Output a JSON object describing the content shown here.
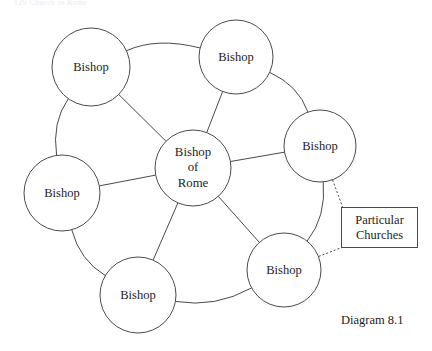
{
  "page_header": "126   Church in Rome",
  "figure": {
    "caption": "Diagram 8.1",
    "callout": {
      "label": "Particular\nChurches",
      "line1": "Particular",
      "line2": "Churches"
    },
    "hub": {
      "label": "Bishop\nof\nRome",
      "line1": "Bishop",
      "line2": "of",
      "line3": "Rome",
      "cx": 193,
      "cy": 168,
      "r": 38
    },
    "ring_nodes": [
      {
        "id": "bishop-top-left",
        "label": "Bishop",
        "cx": 91,
        "cy": 67,
        "r": 39
      },
      {
        "id": "bishop-top-right",
        "label": "Bishop",
        "cx": 236,
        "cy": 57,
        "r": 37
      },
      {
        "id": "bishop-right",
        "label": "Bishop",
        "cx": 320,
        "cy": 146,
        "r": 36
      },
      {
        "id": "bishop-bottom-right",
        "label": "Bishop",
        "cx": 284,
        "cy": 270,
        "r": 37
      },
      {
        "id": "bishop-bottom-left",
        "label": "Bishop",
        "cx": 138,
        "cy": 295,
        "r": 38
      },
      {
        "id": "bishop-left",
        "label": "Bishop",
        "cx": 62,
        "cy": 193,
        "r": 38
      }
    ],
    "callout_box": {
      "x": 341,
      "y": 207,
      "w": 77,
      "h": 41
    },
    "caption_pos": {
      "x": 341,
      "y": 313
    },
    "colors": {
      "stroke": "#4a4a4a",
      "text": "#1d1d1d",
      "background": "#ffffff",
      "header_text": "#e9e9ee"
    }
  }
}
